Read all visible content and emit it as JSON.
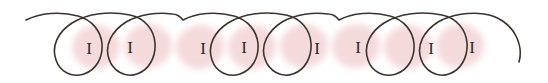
{
  "figure": {
    "kind": "handwriting-annotation",
    "caption": "",
    "background_color": "#ffffff",
    "ink_color": "#3a3430",
    "ink_width": 1.6,
    "highlight_color": "#efc3c6",
    "highlight_opacity": 0.62,
    "glyph_color": "#2f2a26",
    "width": 548,
    "height": 83
  },
  "stroke": {
    "name": "looped-cursive-line",
    "description": "Continuous handwritten line of eight tilted loops joined by arcs along the top, arranged in four pairs, with a flat lead-in tail on the left and a descending tail on the right.",
    "baseline_y": 18,
    "loop_count": 8,
    "group_count": 4,
    "loops_per_group": 2,
    "path": "M 26 20 C 40 13 60 11 78 16 C 92 20 101 31 102 44 C 103 58 96 70 84 74 C 72 78 60 72 56 60 C 51 46 58 32 72 23 C 88 13 110 11 130 15 C 145 18 154 30 155 43 C 156 57 149 70 137 74 C 125 78 113 71 109 59 C 104 45 112 31 126 22 C 140 14 158 12 172 14 M 183 20 C 196 13 216 11 234 16 C 248 20 257 31 258 44 C 259 58 252 70 240 74 C 228 78 216 72 212 60 C 207 46 214 32 228 23 C 244 13 266 11 286 15 C 301 18 310 30 311 43 C 312 57 305 70 293 74 C 281 78 269 71 265 59 C 260 45 268 31 282 22 C 296 14 314 12 328 14 M 339 20 C 352 13 372 11 390 16 C 404 20 413 31 414 44 C 415 58 408 70 396 74 C 384 78 372 72 368 60 C 363 46 370 32 384 23 C 400 13 422 11 442 15 C 457 18 466 30 467 43 C 468 57 461 70 449 74 C 437 78 425 71 421 59 C 416 45 424 31 438 22 C 452 14 470 12 484 14 M 172 14 C 176 14 180 16 183 20 M 328 14 C 332 14 336 16 339 20 M 484 14 C 498 16 510 24 516 36 C 521 46 521 55 519 62",
    "lead_in": {
      "name": "lead-in-tail",
      "path": "M 26 20 C 40 13 58 11 74 14"
    },
    "lead_out": {
      "name": "lead-out-tail",
      "path": "M 484 14 C 498 16 510 24 516 36 C 521 46 521 55 519 62"
    }
  },
  "highlights": [
    {
      "id": "h1",
      "label": "I",
      "cx": 96,
      "cy": 47,
      "rx": 24,
      "ry": 22,
      "rotation": -8
    },
    {
      "id": "h2",
      "label": "I",
      "cx": 148,
      "cy": 46,
      "rx": 24,
      "ry": 22,
      "rotation": -8
    },
    {
      "id": "h3",
      "label": "I",
      "cx": 252,
      "cy": 47,
      "rx": 24,
      "ry": 22,
      "rotation": -8
    },
    {
      "id": "h4",
      "label": "I",
      "cx": 304,
      "cy": 46,
      "rx": 24,
      "ry": 22,
      "rotation": -8
    },
    {
      "id": "h5",
      "label": "I",
      "cx": 408,
      "cy": 47,
      "rx": 24,
      "ry": 22,
      "rotation": -8
    },
    {
      "id": "h6",
      "label": "I",
      "cx": 460,
      "cy": 46,
      "rx": 24,
      "ry": 22,
      "rotation": -8
    },
    {
      "id": "h7",
      "label": "I",
      "cx": 200,
      "cy": 47,
      "rx": 24,
      "ry": 22,
      "rotation": -8
    },
    {
      "id": "h8",
      "label": "I",
      "cx": 356,
      "cy": 46,
      "rx": 24,
      "ry": 22,
      "rotation": -8
    }
  ],
  "glyphs": [
    {
      "id": "g1",
      "text": "I",
      "x": 89,
      "y": 54
    },
    {
      "id": "g2",
      "text": "I",
      "x": 130,
      "y": 53
    },
    {
      "id": "g3",
      "text": "I",
      "x": 203,
      "y": 54
    },
    {
      "id": "g4",
      "text": "I",
      "x": 244,
      "y": 53
    },
    {
      "id": "g5",
      "text": "I",
      "x": 317,
      "y": 54
    },
    {
      "id": "g6",
      "text": "I",
      "x": 358,
      "y": 53
    },
    {
      "id": "g7",
      "text": "I",
      "x": 431,
      "y": 54
    },
    {
      "id": "g8",
      "text": "I",
      "x": 472,
      "y": 53
    }
  ]
}
